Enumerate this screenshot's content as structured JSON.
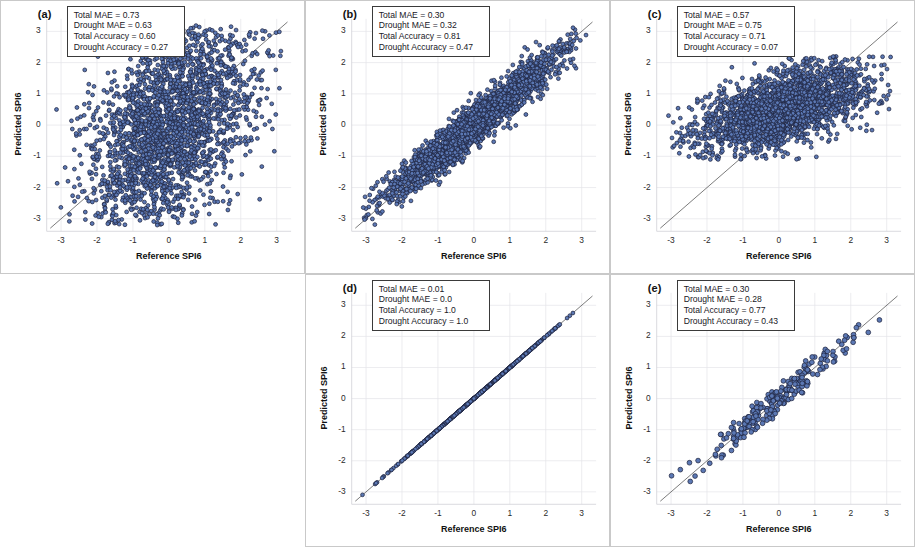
{
  "figure": {
    "axis_x_title": "Reference SPI6",
    "axis_y_title": "Predicted SPI6",
    "tick_labels": [
      "-3",
      "-2",
      "-1",
      "0",
      "1",
      "2",
      "3"
    ],
    "marker_fill": "#5b78b4",
    "marker_stroke": "#1f2540",
    "gridline_color": "#e3e3e8",
    "identity_line_color": "#5a5a5a",
    "panel_border_color": "#c9c9c9"
  },
  "panels": [
    {
      "id": "a",
      "tag": "(a)",
      "stats": [
        "Total MAE = 0.73",
        "Drought MAE = 0.63",
        "Total Accuracy = 0.60",
        "Drought Accuracy = 0.27"
      ],
      "stat_values": {
        "total_mae": 0.73,
        "drought_mae": 0.63,
        "total_accuracy": 0.6,
        "drought_accuracy": 0.27
      }
    },
    {
      "id": "b",
      "tag": "(b)",
      "stats": [
        "Total MAE = 0.30",
        "Drought MAE = 0.32",
        "Total Accuracy = 0.81",
        "Drought Accuracy = 0.47"
      ],
      "stat_values": {
        "total_mae": 0.3,
        "drought_mae": 0.32,
        "total_accuracy": 0.81,
        "drought_accuracy": 0.47
      }
    },
    {
      "id": "c",
      "tag": "(c)",
      "stats": [
        "Total MAE = 0.57",
        "Drought MAE = 0.75",
        "Total Accuracy = 0.71",
        "Drought Accuracy = 0.07"
      ],
      "stat_values": {
        "total_mae": 0.57,
        "drought_mae": 0.75,
        "total_accuracy": 0.71,
        "drought_accuracy": 0.07
      }
    },
    {
      "id": "d",
      "tag": "(d)",
      "stats": [
        "Total MAE = 0.01",
        "Drought MAE = 0.0",
        "Total Accuracy = 1.0",
        "Drought Accuracy = 1.0"
      ],
      "stat_values": {
        "total_mae": 0.01,
        "drought_mae": 0.0,
        "total_accuracy": 1.0,
        "drought_accuracy": 1.0
      }
    },
    {
      "id": "e",
      "tag": "(e)",
      "stats": [
        "Total MAE = 0.30",
        "Drought MAE = 0.28",
        "Total Accuracy = 0.77",
        "Drought Accuracy = 0.43"
      ],
      "stat_values": {
        "total_mae": 0.3,
        "drought_mae": 0.28,
        "total_accuracy": 0.77,
        "drought_accuracy": 0.43
      }
    }
  ],
  "chart_data": {
    "type": "scatter",
    "title": "",
    "xlabel": "Reference SPI6",
    "ylabel": "Predicted SPI6",
    "xlim": [
      -3.4,
      3.4
    ],
    "ylim": [
      -3.4,
      3.4
    ],
    "xticks": [
      -3,
      -2,
      -1,
      0,
      1,
      2,
      3
    ],
    "yticks": [
      -3,
      -2,
      -1,
      0,
      1,
      2,
      3
    ],
    "grid": true,
    "legend": "none",
    "reference_line": {
      "label": "1:1 identity line",
      "from": [
        -3.3,
        -3.3
      ],
      "to": [
        3.3,
        3.3
      ]
    },
    "subplots": [
      {
        "panel": "a",
        "n_points": 2600,
        "correlation": 0.62,
        "spread_minor": 0.8,
        "x_mean": 0.05,
        "x_sd": 1.15,
        "description": "Broad diffuse cloud elongated along the 1:1 line; wide vertical scatter, points fill most of the -3..3 box."
      },
      {
        "panel": "b",
        "n_points": 2600,
        "correlation": 0.93,
        "spread_minor": 0.33,
        "x_mean": 0.0,
        "x_sd": 1.2,
        "description": "Tight elongated ellipse hugging the 1:1 line, narrow band, a few outliers below-right."
      },
      {
        "panel": "c",
        "n_points": 2400,
        "correlation": 0.55,
        "spread_minor": 0.55,
        "x_mean": 0.15,
        "x_sd": 1.2,
        "y_compressed_range": [
          -1.1,
          2.2
        ],
        "description": "Predictions compressed into a narrow vertical band roughly -1 to 2; flattened slope, variance strongly underestimated."
      },
      {
        "panel": "d",
        "n_points": 900,
        "correlation": 0.999,
        "spread_minor": 0.02,
        "x_mean": 0.0,
        "x_sd": 1.0,
        "description": "Points collapse onto the 1:1 line; essentially perfect reconstruction."
      },
      {
        "panel": "e",
        "n_points": 250,
        "correlation": 0.94,
        "spread_minor": 0.3,
        "x_mean": 0.0,
        "x_sd": 1.0,
        "description": "Sparse cloud of a few hundred points following the 1:1 line closely with moderate scatter."
      }
    ]
  }
}
